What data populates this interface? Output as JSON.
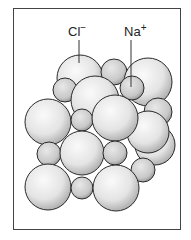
{
  "diagram": {
    "type": "crystal-lattice-space-filling",
    "labels": {
      "chloride": {
        "symbol": "Cl",
        "charge": "−"
      },
      "sodium": {
        "symbol": "Na",
        "charge": "+"
      }
    },
    "colors": {
      "border": "#444444",
      "sphere_fill_light": "#f2f2f2",
      "sphere_fill_dark": "#bdbdbd",
      "sphere_outline": "#2a2a2a"
    }
  }
}
